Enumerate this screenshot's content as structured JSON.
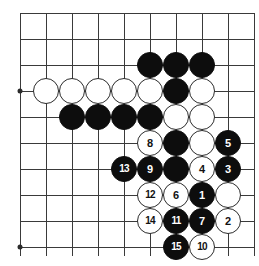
{
  "diagram": {
    "board": {
      "type": "go-goban",
      "grid_origin_x": 20,
      "grid_origin_y": 13,
      "grid_spacing": 26,
      "columns": 10,
      "rows": 10,
      "line_color": "#3a3a3a",
      "background_color": "#ffffff",
      "stone_radius": 13,
      "black_color": "#0d0d0d",
      "white_color": "#ffffff"
    },
    "star_points": [
      {
        "col": 0,
        "row": 3
      },
      {
        "col": 0,
        "row": 9
      }
    ],
    "stones": [
      {
        "col": 5,
        "row": 2,
        "color": "black",
        "label": ""
      },
      {
        "col": 6,
        "row": 2,
        "color": "black",
        "label": ""
      },
      {
        "col": 7,
        "row": 2,
        "color": "black",
        "label": ""
      },
      {
        "col": 1,
        "row": 3,
        "color": "white",
        "label": ""
      },
      {
        "col": 2,
        "row": 3,
        "color": "white",
        "label": ""
      },
      {
        "col": 3,
        "row": 3,
        "color": "white",
        "label": ""
      },
      {
        "col": 4,
        "row": 3,
        "color": "white",
        "label": ""
      },
      {
        "col": 5,
        "row": 3,
        "color": "white",
        "label": ""
      },
      {
        "col": 6,
        "row": 3,
        "color": "black",
        "label": ""
      },
      {
        "col": 7,
        "row": 3,
        "color": "white",
        "label": ""
      },
      {
        "col": 2,
        "row": 4,
        "color": "black",
        "label": ""
      },
      {
        "col": 3,
        "row": 4,
        "color": "black",
        "label": ""
      },
      {
        "col": 4,
        "row": 4,
        "color": "black",
        "label": ""
      },
      {
        "col": 5,
        "row": 4,
        "color": "black",
        "label": ""
      },
      {
        "col": 6,
        "row": 4,
        "color": "white",
        "label": ""
      },
      {
        "col": 7,
        "row": 4,
        "color": "white",
        "label": ""
      },
      {
        "col": 5,
        "row": 5,
        "color": "white",
        "label": "8"
      },
      {
        "col": 6,
        "row": 5,
        "color": "black",
        "label": ""
      },
      {
        "col": 7,
        "row": 5,
        "color": "white",
        "label": ""
      },
      {
        "col": 8,
        "row": 5,
        "color": "black",
        "label": "5"
      },
      {
        "col": 4,
        "row": 6,
        "color": "black",
        "label": "13"
      },
      {
        "col": 5,
        "row": 6,
        "color": "black",
        "label": "9"
      },
      {
        "col": 6,
        "row": 6,
        "color": "black",
        "label": ""
      },
      {
        "col": 7,
        "row": 6,
        "color": "white",
        "label": "4"
      },
      {
        "col": 8,
        "row": 6,
        "color": "black",
        "label": "3"
      },
      {
        "col": 5,
        "row": 7,
        "color": "white",
        "label": "12"
      },
      {
        "col": 6,
        "row": 7,
        "color": "white",
        "label": "6"
      },
      {
        "col": 7,
        "row": 7,
        "color": "black",
        "label": "1"
      },
      {
        "col": 8,
        "row": 7,
        "color": "white",
        "label": ""
      },
      {
        "col": 5,
        "row": 8,
        "color": "white",
        "label": "14"
      },
      {
        "col": 6,
        "row": 8,
        "color": "black",
        "label": "11"
      },
      {
        "col": 7,
        "row": 8,
        "color": "black",
        "label": "7"
      },
      {
        "col": 8,
        "row": 8,
        "color": "white",
        "label": "2"
      },
      {
        "col": 6,
        "row": 9,
        "color": "black",
        "label": "15"
      },
      {
        "col": 7,
        "row": 9,
        "color": "white",
        "label": "10"
      }
    ]
  }
}
